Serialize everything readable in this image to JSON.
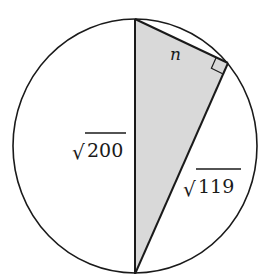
{
  "diagram": {
    "colors": {
      "stroke": "#1a1a1a",
      "fill_triangle": "#d9d9d9",
      "background": "#ffffff"
    },
    "labels": {
      "leg_short": "n",
      "hypotenuse_rad": "200",
      "leg_long_rad": "119",
      "radical_symbol": "√"
    },
    "right_angle_marker": true
  }
}
